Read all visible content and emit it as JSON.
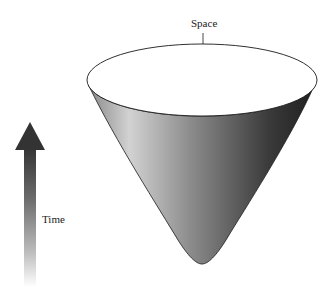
{
  "diagram": {
    "labels": {
      "space": "Space",
      "time": "Time"
    },
    "colors": {
      "cone_light": "#c8c8c8",
      "cone_dark": "#222222",
      "arrow_top": "#3a3a3a",
      "arrow_bottom": "#f4f4f4",
      "outline": "#1a1a1a"
    }
  }
}
